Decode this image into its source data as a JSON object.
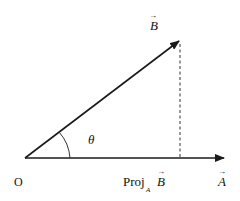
{
  "diagram": {
    "type": "vector-projection",
    "labels": {
      "origin": "O",
      "vector_a": "A",
      "vector_b": "B",
      "angle": "θ",
      "projection_prefix": "Proj",
      "projection_subscript": "A",
      "projection_vector": "B",
      "vector_arrow": "→"
    },
    "colors": {
      "line": "#1a1a1a",
      "background": "#ffffff"
    }
  }
}
